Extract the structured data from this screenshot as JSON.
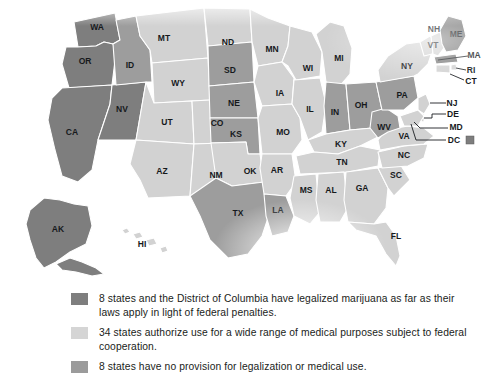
{
  "map": {
    "title": "US marijuana legalization status by state",
    "projection": "albers-usa-stylized",
    "colors": {
      "legalized": "#7e7e7e",
      "medical": "#d2d2d2",
      "no_provision": "#9d9d9d",
      "border": "#ffffff",
      "label_text": "#16191c",
      "background": "#ffffff"
    },
    "categories": [
      {
        "key": "legalized",
        "count": 8,
        "swatch": "#7e7e7e"
      },
      {
        "key": "medical",
        "count": 34,
        "swatch": "#d5d5d5"
      },
      {
        "key": "no_provision",
        "count": 8,
        "swatch": "#9b9b9b"
      }
    ],
    "states": [
      {
        "code": "WA",
        "category": "legalized"
      },
      {
        "code": "OR",
        "category": "legalized"
      },
      {
        "code": "CA",
        "category": "legalized"
      },
      {
        "code": "NV",
        "category": "legalized"
      },
      {
        "code": "AK",
        "category": "legalized"
      },
      {
        "code": "MA",
        "category": "legalized"
      },
      {
        "code": "ME",
        "category": "legalized"
      },
      {
        "code": "CO",
        "category": "medical"
      },
      {
        "code": "DC",
        "category": "legalized"
      },
      {
        "code": "ID",
        "category": "no_provision"
      },
      {
        "code": "SD",
        "category": "no_provision"
      },
      {
        "code": "NE",
        "category": "no_provision"
      },
      {
        "code": "KS",
        "category": "no_provision"
      },
      {
        "code": "TX",
        "category": "no_provision"
      },
      {
        "code": "LA",
        "category": "no_provision"
      },
      {
        "code": "IN",
        "category": "no_provision"
      },
      {
        "code": "OH",
        "category": "no_provision"
      },
      {
        "code": "PA",
        "category": "no_provision"
      },
      {
        "code": "WV",
        "category": "no_provision"
      },
      {
        "code": "MT",
        "category": "medical"
      },
      {
        "code": "WY",
        "category": "medical"
      },
      {
        "code": "UT",
        "category": "medical"
      },
      {
        "code": "AZ",
        "category": "medical"
      },
      {
        "code": "NM",
        "category": "medical"
      },
      {
        "code": "ND",
        "category": "medical"
      },
      {
        "code": "MN",
        "category": "medical"
      },
      {
        "code": "IA",
        "category": "medical"
      },
      {
        "code": "MO",
        "category": "medical"
      },
      {
        "code": "OK",
        "category": "medical"
      },
      {
        "code": "AR",
        "category": "medical"
      },
      {
        "code": "WI",
        "category": "medical"
      },
      {
        "code": "IL",
        "category": "medical"
      },
      {
        "code": "MI",
        "category": "medical"
      },
      {
        "code": "KY",
        "category": "medical"
      },
      {
        "code": "TN",
        "category": "medical"
      },
      {
        "code": "MS",
        "category": "medical"
      },
      {
        "code": "AL",
        "category": "medical"
      },
      {
        "code": "GA",
        "category": "medical"
      },
      {
        "code": "FL",
        "category": "medical"
      },
      {
        "code": "SC",
        "category": "medical"
      },
      {
        "code": "NC",
        "category": "medical"
      },
      {
        "code": "VA",
        "category": "medical"
      },
      {
        "code": "MD",
        "category": "medical"
      },
      {
        "code": "DE",
        "category": "medical"
      },
      {
        "code": "NJ",
        "category": "medical"
      },
      {
        "code": "NY",
        "category": "medical"
      },
      {
        "code": "CT",
        "category": "medical"
      },
      {
        "code": "RI",
        "category": "medical"
      },
      {
        "code": "VT",
        "category": "medical"
      },
      {
        "code": "NH",
        "category": "medical"
      },
      {
        "code": "HI",
        "category": "medical"
      }
    ],
    "labels": {
      "WA": "WA",
      "OR": "OR",
      "CA": "CA",
      "NV": "NV",
      "ID": "ID",
      "MT": "MT",
      "WY": "WY",
      "UT": "UT",
      "CO": "CO",
      "AZ": "AZ",
      "NM": "NM",
      "ND": "ND",
      "SD": "SD",
      "NE": "NE",
      "KS": "KS",
      "OK": "OK",
      "TX": "TX",
      "MN": "MN",
      "IA": "IA",
      "MO": "MO",
      "AR": "AR",
      "LA": "LA",
      "WI": "WI",
      "IL": "IL",
      "MI": "MI",
      "IN": "IN",
      "OH": "OH",
      "KY": "KY",
      "TN": "TN",
      "MS": "MS",
      "AL": "AL",
      "GA": "GA",
      "FL": "FL",
      "SC": "SC",
      "NC": "NC",
      "VA": "VA",
      "WV": "WV",
      "PA": "PA",
      "NY": "NY",
      "VT": "VT",
      "NH": "NH",
      "ME": "ME",
      "MA": "MA",
      "RI": "RI",
      "CT": "CT",
      "NJ": "NJ",
      "DE": "DE",
      "MD": "MD",
      "DC": "DC",
      "AK": "AK",
      "HI": "HI"
    }
  },
  "legend": {
    "items": [
      {
        "swatch_class": "sw-legal",
        "swatch_color": "#7e7e7e",
        "text": "8 states and the District of Columbia have legalized marijuana as far as their laws apply in light of federal penalties."
      },
      {
        "swatch_class": "sw-medical",
        "swatch_color": "#d5d5d5",
        "text": "34 states authorize use for a wide range of medical purposes subject to federal cooperation."
      },
      {
        "swatch_class": "sw-none",
        "swatch_color": "#9b9b9b",
        "text": "8 states have no provision for legalization or medical use."
      }
    ]
  }
}
